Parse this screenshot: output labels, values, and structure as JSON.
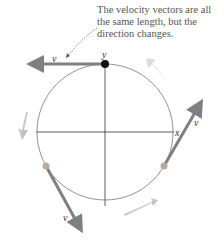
{
  "caption": "The velocity vectors are all the same length, but the direction changes.",
  "labels": {
    "y_axis": "y",
    "x_axis": "x",
    "vector": "v⃗"
  },
  "colors": {
    "vector": "#7f7f82",
    "dot_top": "#111111",
    "dot_other": "#b8a8a0",
    "circle": "#777777",
    "motion_arrow": "#9a9a9a"
  }
}
